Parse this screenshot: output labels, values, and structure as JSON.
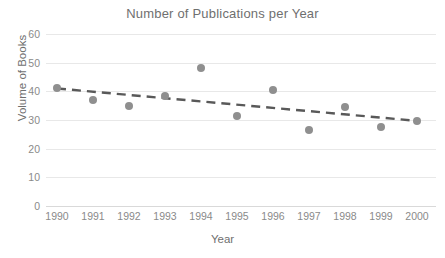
{
  "chart_data": {
    "type": "scatter",
    "title": "Number of Publications per Year",
    "xlabel": "Year",
    "ylabel": "Volume of Books",
    "categories": [
      "1990",
      "1991",
      "1992",
      "1993",
      "1994",
      "1995",
      "1996",
      "1997",
      "1998",
      "1999",
      "2000"
    ],
    "x": [
      1990,
      1991,
      1992,
      1993,
      1994,
      1995,
      1996,
      1997,
      1998,
      1999,
      2000
    ],
    "values": [
      41.0,
      37.0,
      35.0,
      38.2,
      48.3,
      31.3,
      40.6,
      26.5,
      34.6,
      27.7,
      29.7
    ],
    "series": [
      {
        "name": "Volume of Books",
        "values": [
          41.0,
          37.0,
          35.0,
          38.2,
          48.3,
          31.3,
          40.6,
          26.5,
          34.6,
          27.7,
          29.7
        ],
        "marker_color": "#8f8f8f",
        "marker": "circle"
      }
    ],
    "trendline": {
      "type": "linear",
      "style": "dashed",
      "color": "#595959",
      "start": {
        "x": 1990,
        "y": 41.0
      },
      "end": {
        "x": 2000,
        "y": 29.7
      }
    },
    "ylim": [
      0,
      60
    ],
    "ytick_labels": [
      "60",
      "50",
      "40",
      "30",
      "20",
      "10",
      "0"
    ],
    "ytick_values": [
      60,
      50,
      40,
      30,
      20,
      10,
      0
    ],
    "ytick_step": 10,
    "xlim": [
      1990,
      2000
    ],
    "grid": "horizontal",
    "legend": "none",
    "background": "#ffffff",
    "gridline_color": "#e8e8e8",
    "text_color": "#6f6f6f"
  }
}
